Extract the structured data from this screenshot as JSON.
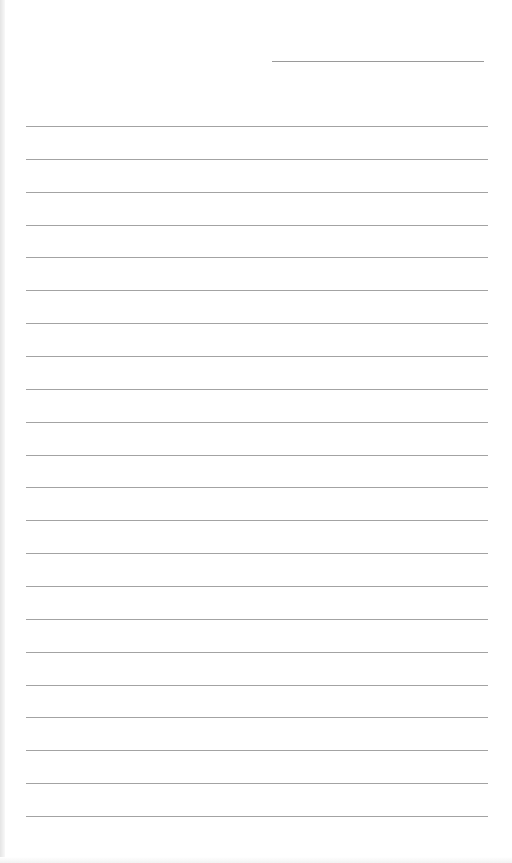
{
  "page": {
    "type": "lined-paper",
    "background": "#ffffff",
    "line_color": "#a3a3a3"
  },
  "header_line": {
    "left": 272,
    "top": 61,
    "width": 212
  },
  "ruled_lines": {
    "count": 22,
    "first_top": 126,
    "spacing": 32.86,
    "left": 26,
    "width": 462
  }
}
